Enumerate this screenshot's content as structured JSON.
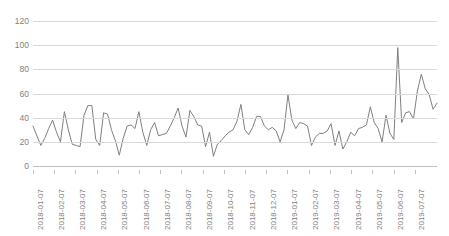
{
  "chart": {
    "title": "",
    "line_color": "#7f7f7f",
    "grid_color": "#d9d9d9",
    "background": "#ffffff"
  },
  "axes": {
    "y_ticks": [
      "0",
      "20",
      "40",
      "60",
      "80",
      "100",
      "120"
    ],
    "x_ticks": [
      "2018-01-07",
      "2018-02-07",
      "2018-03-07",
      "2018-04-07",
      "2018-05-07",
      "2018-06-07",
      "2018-07-07",
      "2018-08-07",
      "2018-09-07",
      "2018-10-07",
      "2018-11-07",
      "2018-12-07",
      "2019-01-07",
      "2019-02-07",
      "2019-03-07",
      "2019-04-07",
      "2019-05-07",
      "2019-06-07",
      "2019-07-07"
    ]
  },
  "chart_data": {
    "type": "line",
    "title": "",
    "xlabel": "",
    "ylabel": "",
    "ylim": [
      0,
      120
    ],
    "ytick_values": [
      0,
      20,
      40,
      60,
      80,
      100,
      120
    ],
    "grid": true,
    "legend": "none",
    "x_tick_labels": [
      "2018-01-07",
      "2018-02-07",
      "2018-03-07",
      "2018-04-07",
      "2018-05-07",
      "2018-06-07",
      "2018-07-07",
      "2018-08-07",
      "2018-09-07",
      "2018-10-07",
      "2018-11-07",
      "2018-12-07",
      "2019-01-07",
      "2019-02-07",
      "2019-03-07",
      "2019-04-07",
      "2019-05-07",
      "2019-06-07",
      "2019-07-07"
    ],
    "x_tick_interval": "1 month",
    "x_start": "2018-01-07",
    "x_end": "2019-07-28",
    "point_interval": "weekly",
    "series": [
      {
        "name": "value",
        "color": "#7f7f7f",
        "values": [
          33,
          25,
          17,
          23,
          31,
          38,
          28,
          20,
          45,
          30,
          18,
          17,
          16,
          42,
          50,
          50,
          22,
          17,
          44,
          43,
          30,
          21,
          9,
          23,
          33,
          34,
          31,
          45,
          28,
          17,
          30,
          36,
          25,
          26,
          27,
          33,
          40,
          48,
          33,
          24,
          46,
          41,
          34,
          33,
          16,
          28,
          8,
          18,
          21,
          25,
          28,
          30,
          37,
          51,
          30,
          26,
          32,
          41,
          41,
          33,
          30,
          32,
          29,
          20,
          30,
          59,
          38,
          31,
          36,
          35,
          33,
          17,
          24,
          27,
          27,
          29,
          35,
          17,
          29,
          14,
          20,
          28,
          25,
          31,
          32,
          34,
          49,
          36,
          31,
          20,
          42,
          27,
          22,
          98,
          36,
          44,
          45,
          39,
          62,
          76,
          64,
          59,
          47,
          52
        ]
      }
    ]
  }
}
